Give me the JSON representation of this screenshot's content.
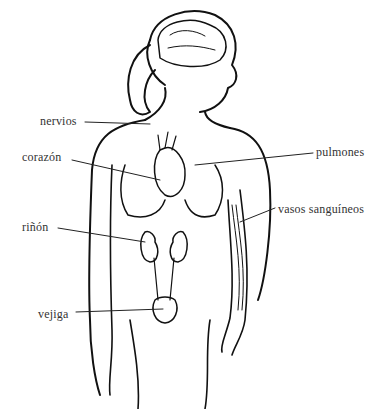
{
  "diagram": {
    "title": "",
    "labels": [
      {
        "id": "nervios",
        "text": "nervios",
        "x": 40,
        "y": 114
      },
      {
        "id": "corazon",
        "text": "corazón",
        "x": 22,
        "y": 150
      },
      {
        "id": "pulmones",
        "text": "pulmones",
        "x": 316,
        "y": 148
      },
      {
        "id": "vasos",
        "text": "vasos sanguíneos",
        "x": 278,
        "y": 204
      },
      {
        "id": "rinon",
        "text": "riñón",
        "x": 22,
        "y": 222
      },
      {
        "id": "vejiga",
        "text": "vejiga",
        "x": 38,
        "y": 311
      }
    ]
  }
}
